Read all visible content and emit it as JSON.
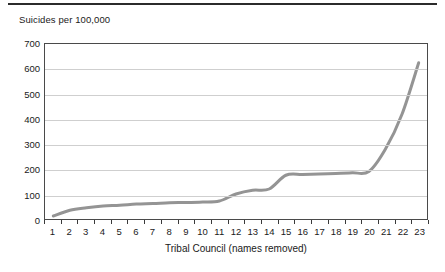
{
  "figure": {
    "y_axis_title": "Suicides per 100,000",
    "x_axis_title": "Tribal Council (names removed)"
  },
  "chart_data": {
    "type": "line",
    "title": "",
    "subtitle": "",
    "xlabel": "Tribal Council (names removed)",
    "ylabel": "Suicides per 100,000",
    "categories": [
      "1",
      "2",
      "3",
      "4",
      "5",
      "6",
      "7",
      "8",
      "9",
      "10",
      "11",
      "12",
      "13",
      "14",
      "15",
      "16",
      "17",
      "18",
      "19",
      "20",
      "21",
      "22",
      "23"
    ],
    "values": [
      12,
      35,
      45,
      52,
      55,
      60,
      62,
      65,
      66,
      68,
      72,
      100,
      115,
      120,
      175,
      178,
      180,
      182,
      185,
      190,
      280,
      420,
      625
    ],
    "ylim": [
      0,
      700
    ],
    "ytick_labels": [
      "0",
      "100",
      "200",
      "300",
      "400",
      "500",
      "600",
      "700"
    ],
    "ytick_values": [
      0,
      100,
      200,
      300,
      400,
      500,
      600,
      700
    ],
    "grid": "horizontal",
    "legend": "none",
    "line_color": "#949494",
    "line_width": 3,
    "axis_color": "#4a4a4a",
    "grid_color": "#cfcfcf",
    "markers": "none"
  }
}
